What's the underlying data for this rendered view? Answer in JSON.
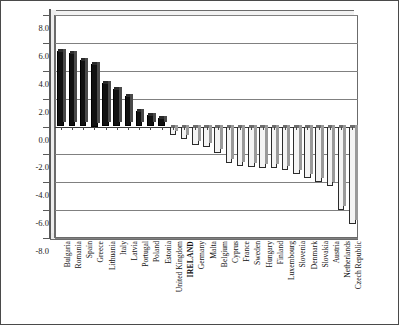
{
  "chart_data": {
    "type": "bar",
    "title": "",
    "subtitle": "",
    "xlabel": "",
    "ylabel": "",
    "ylim": [
      -8.0,
      8.0
    ],
    "ytick_step": 2.0,
    "ytick_labels": [
      "8.0",
      "6.0",
      "4.0",
      "2.0",
      "0.0",
      "-2.0",
      "-4.0",
      "-6.0",
      "-8.0"
    ],
    "ytick_values": [
      8.0,
      6.0,
      4.0,
      2.0,
      0.0,
      -2.0,
      -4.0,
      -6.0,
      -8.0
    ],
    "grid": true,
    "legend": "none",
    "highlight_category": "IRELAND",
    "positive_fill": "#111111",
    "negative_fill": "#f4f4f4",
    "categories": [
      "Bulgaria",
      "Romania",
      "Spain",
      "Greece",
      "Lithuania",
      "Italy",
      "Latvia",
      "Portugal",
      "Poland",
      "Estonia",
      "United Kingdom",
      "IRELAND",
      "Germany",
      "Malta",
      "Belgium",
      "Cyprus",
      "France",
      "Sweden",
      "Hungary",
      "Finland",
      "Luxembourg",
      "Slovenia",
      "Denmark",
      "Slovakia",
      "Austria",
      "Netherlands",
      "Czech Republic"
    ],
    "values": [
      5.4,
      5.3,
      4.8,
      4.5,
      3.1,
      2.7,
      2.2,
      1.1,
      0.85,
      0.6,
      -0.6,
      -0.9,
      -1.3,
      -1.5,
      -1.9,
      -2.6,
      -2.8,
      -2.9,
      -3.0,
      -3.0,
      -3.1,
      -3.4,
      -3.7,
      -4.0,
      -4.3,
      -6.0,
      -7.0
    ]
  },
  "figure": {
    "border_color": "#4a4a4a",
    "background": "#ffffff"
  }
}
